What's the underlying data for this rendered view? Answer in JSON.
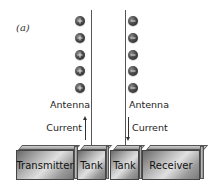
{
  "figure": {
    "panel_label": "(a)",
    "left": {
      "charge_sign": "+",
      "charge_count": 5,
      "antenna_label": "Antenna",
      "current_label": "Current",
      "current_direction": "up",
      "boxes": [
        "Transmitter",
        "Tank"
      ]
    },
    "right": {
      "charge_sign": "−",
      "charge_count": 5,
      "antenna_label": "Antenna",
      "current_label": "Current",
      "current_direction": "down",
      "boxes": [
        "Tank",
        "Receiver"
      ]
    }
  },
  "colors": {
    "charge": "#3a3a3a",
    "box": "#b0b0b0",
    "line": "#555555",
    "text": "#222222"
  }
}
